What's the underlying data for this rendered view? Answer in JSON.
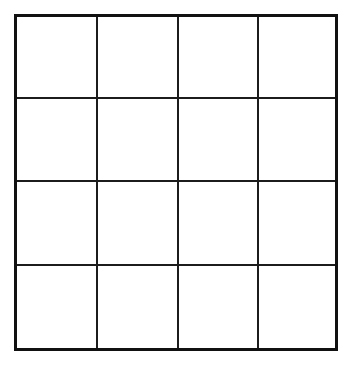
{
  "figure": {
    "kind": "empty-grid",
    "title": "",
    "rows": 4,
    "columns": 4,
    "cell_count": 16,
    "background_color": "#ffffff",
    "line_color": "#1c1c1c",
    "border_color": "#111111",
    "border_thickness_px": 3,
    "inner_line_thickness_px": 2,
    "cells": [
      {
        "row": 1,
        "column": 1,
        "label": ""
      },
      {
        "row": 1,
        "column": 2,
        "label": ""
      },
      {
        "row": 1,
        "column": 3,
        "label": ""
      },
      {
        "row": 1,
        "column": 4,
        "label": ""
      },
      {
        "row": 2,
        "column": 1,
        "label": ""
      },
      {
        "row": 2,
        "column": 2,
        "label": ""
      },
      {
        "row": 2,
        "column": 3,
        "label": ""
      },
      {
        "row": 2,
        "column": 4,
        "label": ""
      },
      {
        "row": 3,
        "column": 1,
        "label": ""
      },
      {
        "row": 3,
        "column": 2,
        "label": ""
      },
      {
        "row": 3,
        "column": 3,
        "label": ""
      },
      {
        "row": 3,
        "column": 4,
        "label": ""
      },
      {
        "row": 4,
        "column": 1,
        "label": ""
      },
      {
        "row": 4,
        "column": 2,
        "label": ""
      },
      {
        "row": 4,
        "column": 3,
        "label": ""
      },
      {
        "row": 4,
        "column": 4,
        "label": ""
      }
    ],
    "vertical_lines": [
      {
        "index": 1,
        "x": 96
      },
      {
        "index": 2,
        "x": 177
      },
      {
        "index": 3,
        "x": 257
      }
    ],
    "horizontal_lines": [
      {
        "index": 1,
        "y": 97
      },
      {
        "index": 2,
        "y": 180
      },
      {
        "index": 3,
        "y": 264
      }
    ],
    "bounds": {
      "left": 14,
      "top": 14,
      "right": 338,
      "bottom": 351
    }
  }
}
